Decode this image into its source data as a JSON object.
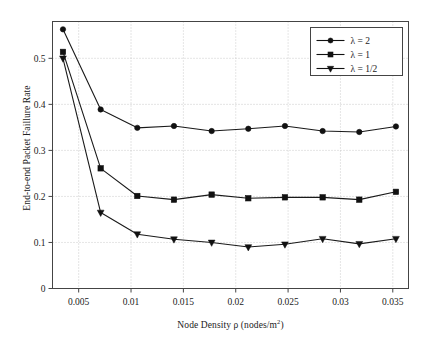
{
  "chart_data": {
    "type": "line",
    "title": "",
    "xlabel": "Node Density ρ (nodes/m²)",
    "ylabel": "End-to-end Packet Faillure Rate",
    "xlim": [
      0.0025,
      0.0365
    ],
    "ylim": [
      0,
      0.58
    ],
    "grid": true,
    "grid_style": "dotted",
    "legend_position": "top-right",
    "xticks": [
      0.005,
      0.01,
      0.015,
      0.02,
      0.025,
      0.03,
      0.035
    ],
    "xtick_labels": [
      "0.005",
      "0.01",
      "0.015",
      "0.02",
      "0.025",
      "0.03",
      "0.035"
    ],
    "yticks": [
      0,
      0.1,
      0.2,
      0.3,
      0.4,
      0.5
    ],
    "ytick_labels": [
      "0",
      "0.1",
      "0.2",
      "0.3",
      "0.4",
      "0.5"
    ],
    "x": [
      0.0035,
      0.0071,
      0.0106,
      0.0141,
      0.0177,
      0.0212,
      0.0247,
      0.0283,
      0.0318,
      0.0353
    ],
    "series": [
      {
        "name": "λ = 2",
        "marker": "circle",
        "color": "#1a1a1a",
        "values": [
          0.563,
          0.389,
          0.349,
          0.353,
          0.342,
          0.347,
          0.353,
          0.342,
          0.34,
          0.352
        ]
      },
      {
        "name": "λ = 1",
        "marker": "square",
        "color": "#1a1a1a",
        "values": [
          0.514,
          0.261,
          0.201,
          0.193,
          0.204,
          0.196,
          0.198,
          0.198,
          0.193,
          0.21
        ]
      },
      {
        "name": "λ = 1/2",
        "marker": "triangle-down",
        "color": "#1a1a1a",
        "values": [
          0.5,
          0.165,
          0.118,
          0.107,
          0.1,
          0.09,
          0.096,
          0.108,
          0.097,
          0.108
        ]
      }
    ]
  },
  "legend": {
    "entries": [
      {
        "label": "λ = 2",
        "marker": "circle"
      },
      {
        "label": "λ = 1",
        "marker": "square"
      },
      {
        "label": "λ = 1/2",
        "marker": "triangle-down"
      }
    ]
  },
  "axes": {
    "x_title": "Node Density ρ (nodes/m",
    "x_title_sup": "2",
    "x_title_tail": ")",
    "y_title": "End-to-end Packet Faillure Rate"
  }
}
